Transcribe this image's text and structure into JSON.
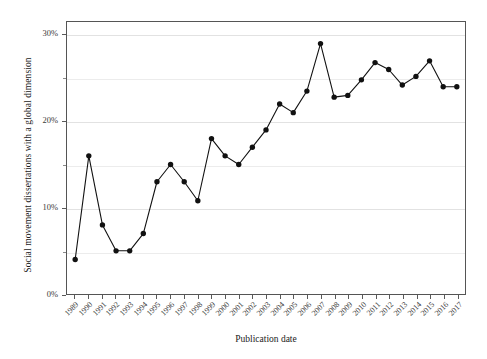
{
  "figure": {
    "background_color": "#ffffff",
    "frame_color": "#555555",
    "marker_color": "#111111",
    "line_color": "#111111",
    "gridline_color": "#e8e8e8"
  },
  "chart_data": {
    "type": "line",
    "title": "",
    "subtitle": "",
    "xlabel": "Publication date",
    "ylabel": "Social movement dissertations with a global dimension",
    "x": [
      1989,
      1990,
      1991,
      1992,
      1993,
      1994,
      1995,
      1996,
      1997,
      1998,
      1999,
      2000,
      2001,
      2002,
      2003,
      2004,
      2005,
      2006,
      2007,
      2008,
      2009,
      2010,
      2011,
      2012,
      2013,
      2014,
      2015,
      2016,
      2017
    ],
    "categories": [
      "1989",
      "1990",
      "1991",
      "1992",
      "1993",
      "1994",
      "1995",
      "1996",
      "1997",
      "1998",
      "1999",
      "2000",
      "2001",
      "2002",
      "2003",
      "2004",
      "2005",
      "2006",
      "2007",
      "2008",
      "2009",
      "2010",
      "2011",
      "2012",
      "2013",
      "2014",
      "2015",
      "2016",
      "2017"
    ],
    "values": [
      4,
      16,
      8,
      5,
      5,
      7,
      13,
      15,
      13,
      10.8,
      18,
      16,
      15,
      17,
      19,
      22,
      21,
      23.5,
      29,
      22.8,
      23,
      24.8,
      26.8,
      26,
      24.2,
      25.2,
      27,
      24,
      24
    ],
    "series": [
      {
        "name": "Social movement dissertations with a global dimension",
        "values": [
          4,
          16,
          8,
          5,
          5,
          7,
          13,
          15,
          13,
          10.8,
          18,
          16,
          15,
          17,
          19,
          22,
          21,
          23.5,
          29,
          22.8,
          23,
          24.8,
          26.8,
          26,
          24.2,
          25.2,
          27,
          24,
          24
        ]
      }
    ],
    "xlim": [
      1988.4,
      2017.6
    ],
    "ylim": [
      0,
      31.5
    ],
    "ytick_values": [
      0,
      10,
      20,
      30
    ],
    "ytick_labels": [
      "0%",
      "10%",
      "20%",
      "30%"
    ],
    "yminor_tick_values": [
      5,
      15,
      25
    ],
    "gridlines": true,
    "legend": "none",
    "markers": "filled-circle",
    "value_format": "percent"
  },
  "axes": {
    "y_title": "Social movement dissertations with a global dimension",
    "x_title": "Publication date",
    "y_ticks": [
      {
        "label": "30%",
        "value": 30
      },
      {
        "label": "20%",
        "value": 20
      },
      {
        "label": "10%",
        "value": 10
      },
      {
        "label": "0%",
        "value": 0
      }
    ],
    "x_ticks": [
      "1989",
      "1990",
      "1991",
      "1992",
      "1993",
      "1994",
      "1995",
      "1996",
      "1997",
      "1998",
      "1999",
      "2000",
      "2001",
      "2002",
      "2003",
      "2004",
      "2005",
      "2006",
      "2007",
      "2008",
      "2009",
      "2010",
      "2011",
      "2012",
      "2013",
      "2014",
      "2015",
      "2016",
      "2017"
    ]
  }
}
